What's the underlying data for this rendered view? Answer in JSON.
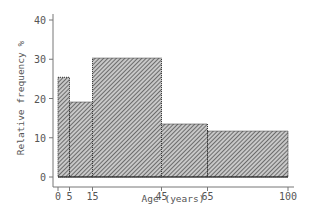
{
  "chart_data": {
    "type": "bar",
    "subtype": "histogram",
    "title": "",
    "xlabel": "Age (years)",
    "ylabel": "Relative frequency %",
    "bins": [
      {
        "start": 0,
        "end": 5,
        "value": 25.4
      },
      {
        "start": 5,
        "end": 15,
        "value": 19.1
      },
      {
        "start": 15,
        "end": 45,
        "value": 30.3
      },
      {
        "start": 45,
        "end": 65,
        "value": 13.5
      },
      {
        "start": 65,
        "end": 100,
        "value": 11.7
      }
    ],
    "categories": [
      "0-5",
      "5-15",
      "15-45",
      "45-65",
      "65-100"
    ],
    "values": [
      25.4,
      19.1,
      30.3,
      13.5,
      11.7
    ],
    "xticks": [
      0,
      5,
      15,
      45,
      65,
      100
    ],
    "yticks": [
      0,
      10,
      20,
      30,
      40
    ],
    "xlim": [
      0,
      100
    ],
    "ylim": [
      0,
      40
    ],
    "grid": false,
    "legend": null,
    "fill_pattern": "diagonal-hatch",
    "colors": {
      "bar_fill": "#9a9a9a",
      "bar_edge": "#333333",
      "axis": "#777777",
      "text": "#555555"
    }
  }
}
